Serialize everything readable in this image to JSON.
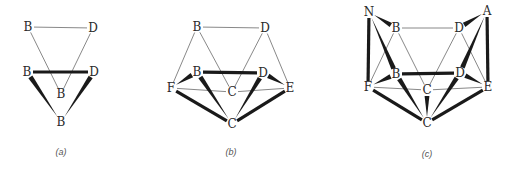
{
  "figure": {
    "colors": {
      "background": "#ffffff",
      "thin_edge": "#6a6a6a",
      "bold_edge": "#1a1a1a",
      "label": "#2a2a2a",
      "caption": "#555555"
    },
    "panels": [
      {
        "id": "a",
        "caption": "(a)",
        "caption_pos": [
          61,
          155
        ],
        "nodes": [
          {
            "id": "B1",
            "label": "B",
            "x": 28,
            "y": 27
          },
          {
            "id": "D1",
            "label": "D",
            "x": 93,
            "y": 28
          },
          {
            "id": "B2",
            "label": "B",
            "x": 27,
            "y": 72
          },
          {
            "id": "D2",
            "label": "D",
            "x": 94,
            "y": 72
          },
          {
            "id": "B3",
            "label": "B",
            "x": 61,
            "y": 94
          },
          {
            "id": "B4",
            "label": "B",
            "x": 61,
            "y": 122
          }
        ],
        "edges": [
          {
            "from": "B1",
            "to": "D1",
            "style": "thin"
          },
          {
            "from": "B1",
            "to": "B3",
            "style": "thin"
          },
          {
            "from": "D1",
            "to": "B3",
            "style": "thin"
          },
          {
            "from": "B2",
            "to": "D2",
            "style": "thick"
          },
          {
            "from": "B4",
            "to": "B2",
            "style": "wedge"
          },
          {
            "from": "B4",
            "to": "D2",
            "style": "wedge"
          }
        ]
      },
      {
        "id": "b",
        "caption": "(b)",
        "caption_pos": [
          231,
          155
        ],
        "nodes": [
          {
            "id": "B1",
            "label": "B",
            "x": 197,
            "y": 27
          },
          {
            "id": "D1",
            "label": "D",
            "x": 265,
            "y": 28
          },
          {
            "id": "B2",
            "label": "B",
            "x": 197,
            "y": 72
          },
          {
            "id": "D2",
            "label": "D",
            "x": 263,
            "y": 73
          },
          {
            "id": "F",
            "label": "F",
            "x": 171,
            "y": 88
          },
          {
            "id": "E",
            "label": "E",
            "x": 290,
            "y": 88
          },
          {
            "id": "C1",
            "label": "C",
            "x": 232,
            "y": 92
          },
          {
            "id": "C2",
            "label": "C",
            "x": 232,
            "y": 124
          }
        ],
        "edges": [
          {
            "from": "B1",
            "to": "D1",
            "style": "thin"
          },
          {
            "from": "B1",
            "to": "F",
            "style": "thin"
          },
          {
            "from": "B1",
            "to": "C1",
            "style": "thin"
          },
          {
            "from": "D1",
            "to": "C1",
            "style": "thin"
          },
          {
            "from": "D1",
            "to": "E",
            "style": "thin"
          },
          {
            "from": "F",
            "to": "C1",
            "style": "thin"
          },
          {
            "from": "E",
            "to": "C1",
            "style": "thin"
          },
          {
            "from": "B2",
            "to": "D2",
            "style": "thick"
          },
          {
            "from": "F",
            "to": "B2",
            "style": "wedge"
          },
          {
            "from": "E",
            "to": "D2",
            "style": "wedge"
          },
          {
            "from": "C2",
            "to": "B2",
            "style": "wedge"
          },
          {
            "from": "C2",
            "to": "D2",
            "style": "wedge"
          },
          {
            "from": "F",
            "to": "C2",
            "style": "thick"
          },
          {
            "from": "E",
            "to": "C2",
            "style": "thick"
          }
        ]
      },
      {
        "id": "c",
        "caption": "(c)",
        "caption_pos": [
          427,
          157
        ],
        "nodes": [
          {
            "id": "N",
            "label": "N",
            "x": 369,
            "y": 12
          },
          {
            "id": "A",
            "label": "A",
            "x": 487,
            "y": 11
          },
          {
            "id": "B1",
            "label": "B",
            "x": 396,
            "y": 28
          },
          {
            "id": "D1",
            "label": "D",
            "x": 459,
            "y": 28
          },
          {
            "id": "B2",
            "label": "B",
            "x": 396,
            "y": 74
          },
          {
            "id": "D2",
            "label": "D",
            "x": 460,
            "y": 73
          },
          {
            "id": "F",
            "label": "F",
            "x": 368,
            "y": 87
          },
          {
            "id": "E",
            "label": "E",
            "x": 488,
            "y": 87
          },
          {
            "id": "C1",
            "label": "C",
            "x": 427,
            "y": 90
          },
          {
            "id": "C2",
            "label": "C",
            "x": 427,
            "y": 123
          }
        ],
        "edges": [
          {
            "from": "B1",
            "to": "D1",
            "style": "thin"
          },
          {
            "from": "B1",
            "to": "F",
            "style": "thin"
          },
          {
            "from": "B1",
            "to": "C1",
            "style": "thin"
          },
          {
            "from": "D1",
            "to": "C1",
            "style": "thin"
          },
          {
            "from": "D1",
            "to": "E",
            "style": "thin"
          },
          {
            "from": "F",
            "to": "C1",
            "style": "thin"
          },
          {
            "from": "E",
            "to": "C1",
            "style": "thin"
          },
          {
            "from": "N",
            "to": "B1",
            "style": "wedge"
          },
          {
            "from": "A",
            "to": "D1",
            "style": "wedge"
          },
          {
            "from": "N",
            "to": "F",
            "style": "thick"
          },
          {
            "from": "A",
            "to": "E",
            "style": "thick"
          },
          {
            "from": "N",
            "to": "B2",
            "style": "wedge"
          },
          {
            "from": "A",
            "to": "D2",
            "style": "wedge"
          },
          {
            "from": "B2",
            "to": "D2",
            "style": "thick"
          },
          {
            "from": "F",
            "to": "B2",
            "style": "wedge"
          },
          {
            "from": "E",
            "to": "D2",
            "style": "wedge"
          },
          {
            "from": "C2",
            "to": "B2",
            "style": "wedge"
          },
          {
            "from": "C2",
            "to": "D2",
            "style": "wedge"
          },
          {
            "from": "C2",
            "to": "C1",
            "style": "wedge"
          },
          {
            "from": "F",
            "to": "C2",
            "style": "thick"
          },
          {
            "from": "E",
            "to": "C2",
            "style": "thick"
          }
        ]
      }
    ]
  }
}
